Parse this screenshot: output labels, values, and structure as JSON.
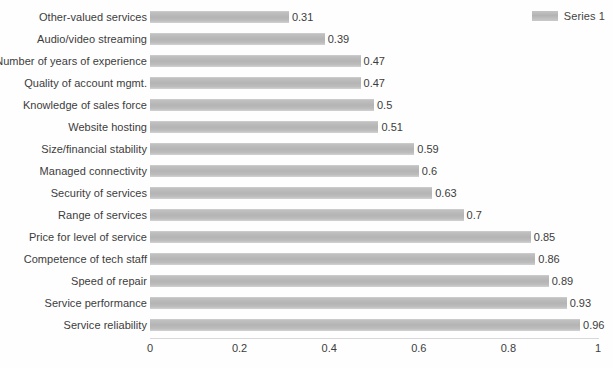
{
  "legend": {
    "entries": [
      {
        "label": "Series 1",
        "color": "#b9b9b9"
      }
    ],
    "position": "top-right"
  },
  "axis": {
    "x_ticks": [
      "0",
      "0.2",
      "0.4",
      "0.6",
      "0.8",
      "1"
    ],
    "x_tick_values": [
      0,
      0.2,
      0.4,
      0.6,
      0.8,
      1
    ]
  },
  "chart_data": {
    "type": "bar",
    "orientation": "horizontal",
    "title": "",
    "subtitle": "",
    "xlabel": "",
    "ylabel": "",
    "xlim": [
      0,
      1
    ],
    "grid": false,
    "legend_position": "top-right",
    "bar_color": "#b9b9b9",
    "categories": [
      "Other-valued services",
      "Audio/video streaming",
      "Number of years of experience",
      "Quality of account mgmt.",
      "Knowledge of sales force",
      "Website hosting",
      "Size/financial stability",
      "Managed connectivity",
      "Security of services",
      "Range of services",
      "Price for level of service",
      "Competence of tech staff",
      "Speed of repair",
      "Service performance",
      "Service reliability"
    ],
    "series": [
      {
        "name": "Series 1",
        "values": [
          0.31,
          0.39,
          0.47,
          0.47,
          0.5,
          0.51,
          0.59,
          0.6,
          0.63,
          0.7,
          0.85,
          0.86,
          0.89,
          0.93,
          0.96
        ]
      }
    ],
    "data_labels": [
      "0.31",
      "0.39",
      "0.47",
      "0.47",
      "0.5",
      "0.51",
      "0.59",
      "0.6",
      "0.63",
      "0.7",
      "0.85",
      "0.86",
      "0.89",
      "0.93",
      "0.96"
    ],
    "xticks": [
      0,
      0.2,
      0.4,
      0.6,
      0.8,
      1
    ],
    "xticklabels": [
      "0",
      "0.2",
      "0.4",
      "0.6",
      "0.8",
      "1"
    ]
  }
}
